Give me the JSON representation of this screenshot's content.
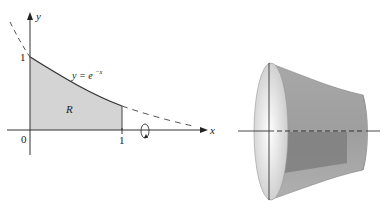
{
  "figure": {
    "left_panel": {
      "axes": {
        "x_label": "x",
        "y_label": "y"
      },
      "ticks": {
        "origin": "0",
        "x_one": "1",
        "y_one": "1"
      },
      "curve_label": {
        "lhs": "y = e",
        "exponent": "−x"
      },
      "region_label": "R",
      "region_fill": "#d4d4d4",
      "curve_color": "#333333",
      "rotation_axis": "x-axis"
    },
    "right_panel": {
      "solid_description": "solid of revolution of R about the x-axis",
      "body_color": "#9a9a9a",
      "face_color": "#e6e6e6",
      "cross_section_color": "#7e7e7e"
    }
  }
}
